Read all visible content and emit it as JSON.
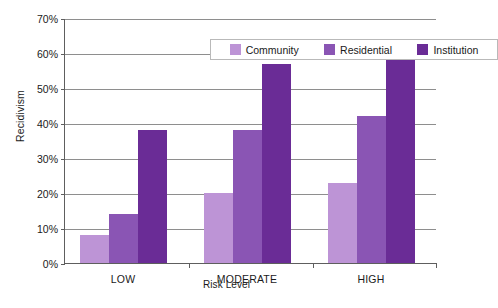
{
  "chart_data": {
    "type": "bar",
    "title": "",
    "subtitle": "",
    "xlabel": "Risk Level",
    "ylabel": "Recidivism",
    "categories": [
      "LOW",
      "MODERATE",
      "HIGH"
    ],
    "series": [
      {
        "name": "Community",
        "values": [
          8,
          20,
          23
        ],
        "color": "#bd94d6"
      },
      {
        "name": "Residential",
        "values": [
          14,
          38,
          42
        ],
        "color": "#8a55b4"
      },
      {
        "name": "Institution",
        "values": [
          38,
          57,
          59
        ],
        "color": "#6a2c96"
      }
    ],
    "ylim": [
      0,
      70
    ],
    "ytick_labels": [
      "0%",
      "10%",
      "20%",
      "30%",
      "40%",
      "50%",
      "60%",
      "70%"
    ],
    "ytick_values": [
      0,
      10,
      20,
      30,
      40,
      50,
      60,
      70
    ],
    "value_suffix": "%",
    "grid": true,
    "grid_axis": "y",
    "legend_position": "top-inside",
    "legend_entries": [
      "Community",
      "Residential",
      "Institution"
    ]
  },
  "colors": {
    "community": "#bd94d6",
    "residential": "#8a55b4",
    "institution": "#6a2c96",
    "axis": "#5e5e5e",
    "gridline": "#8e8e8e",
    "legend_border": "#b9b9b9",
    "background": "#ffffff",
    "text": "#1a1a1a"
  }
}
